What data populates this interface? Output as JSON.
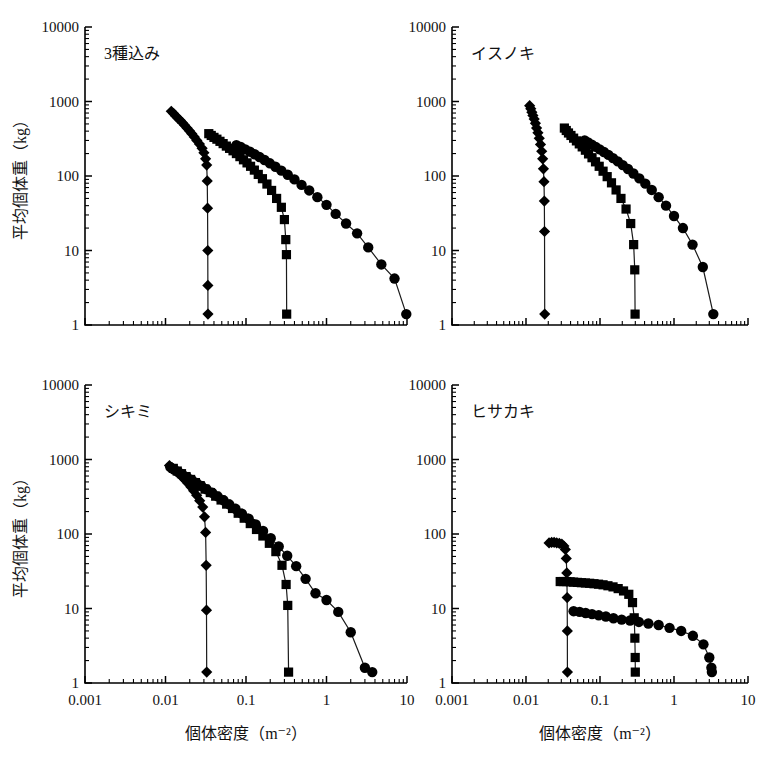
{
  "figure": {
    "axis_titles": {
      "x": "個体密度（m⁻²）",
      "y": "平均個体重（kg）"
    },
    "x_tick_labels": [
      "0.001",
      "0.01",
      "0.1",
      "1",
      "10"
    ],
    "y_tick_labels": [
      "10000",
      "1000",
      "100",
      "10",
      "1"
    ]
  },
  "chart_data": [
    {
      "type": "line",
      "title": "3種込み",
      "panel": "top-left",
      "xlabel": "個体密度（m⁻²）",
      "ylabel": "平均個体重（kg）",
      "xscale": "log",
      "yscale": "log",
      "xlim": [
        0.001,
        10
      ],
      "ylim": [
        1,
        10000
      ],
      "grid": false,
      "legend": "none",
      "series": [
        {
          "name": "diamond",
          "marker": "diamond",
          "x": [
            0.0118,
            0.0126,
            0.0134,
            0.0142,
            0.0152,
            0.0162,
            0.0173,
            0.0185,
            0.0198,
            0.0212,
            0.0228,
            0.0245,
            0.0264,
            0.0285,
            0.03,
            0.0315,
            0.0325,
            0.033,
            0.0333,
            0.0335,
            0.0336,
            0.0337
          ],
          "y": [
            740,
            690,
            640,
            600,
            560,
            520,
            480,
            440,
            405,
            370,
            335,
            300,
            268,
            235,
            205,
            170,
            140,
            86,
            37,
            10,
            3.4,
            1.4
          ]
        },
        {
          "name": "square",
          "marker": "square",
          "x": [
            0.0345,
            0.037,
            0.04,
            0.0435,
            0.0475,
            0.052,
            0.057,
            0.0625,
            0.069,
            0.076,
            0.084,
            0.093,
            0.103,
            0.114,
            0.127,
            0.142,
            0.16,
            0.182,
            0.208,
            0.24,
            0.275,
            0.3,
            0.312,
            0.318,
            0.32
          ],
          "y": [
            370,
            350,
            330,
            312,
            292,
            272,
            252,
            235,
            218,
            200,
            182,
            165,
            150,
            135,
            120,
            105,
            92,
            78,
            64,
            50,
            38,
            26,
            14,
            8.8,
            1.4
          ]
        },
        {
          "name": "circle",
          "marker": "circle",
          "x": [
            0.076,
            0.086,
            0.098,
            0.112,
            0.128,
            0.147,
            0.17,
            0.198,
            0.232,
            0.275,
            0.33,
            0.4,
            0.49,
            0.61,
            0.77,
            1.0,
            1.3,
            1.75,
            2.4,
            3.3,
            4.8,
            7.0,
            9.8
          ],
          "y": [
            260,
            245,
            228,
            212,
            196,
            180,
            164,
            148,
            133,
            118,
            104,
            90,
            76,
            64,
            52,
            41,
            31,
            23,
            17,
            11,
            6.5,
            4.2,
            1.4
          ]
        }
      ]
    },
    {
      "type": "line",
      "title": "イスノキ",
      "panel": "top-right",
      "xlabel": "個体密度（m⁻²）",
      "ylabel": "平均個体重（kg）",
      "xscale": "log",
      "yscale": "log",
      "xlim": [
        0.001,
        10
      ],
      "ylim": [
        1,
        10000
      ],
      "grid": false,
      "legend": "none",
      "series": [
        {
          "name": "diamond",
          "marker": "diamond",
          "x": [
            0.0112,
            0.0116,
            0.012,
            0.0124,
            0.0129,
            0.0134,
            0.0139,
            0.0145,
            0.0151,
            0.0157,
            0.0163,
            0.0168,
            0.0172,
            0.0175,
            0.0177,
            0.0178,
            0.0179
          ],
          "y": [
            880,
            800,
            720,
            650,
            580,
            510,
            440,
            380,
            320,
            265,
            215,
            170,
            125,
            84,
            46,
            18,
            1.4
          ]
        },
        {
          "name": "square",
          "marker": "square",
          "x": [
            0.033,
            0.035,
            0.0375,
            0.0405,
            0.044,
            0.048,
            0.0525,
            0.0575,
            0.0635,
            0.07,
            0.078,
            0.087,
            0.0975,
            0.11,
            0.125,
            0.143,
            0.165,
            0.192,
            0.225,
            0.26,
            0.285,
            0.295,
            0.298
          ],
          "y": [
            440,
            408,
            378,
            350,
            322,
            296,
            270,
            246,
            222,
            198,
            176,
            155,
            135,
            116,
            98,
            81,
            65,
            50,
            36,
            23,
            12,
            5.5,
            1.4
          ]
        },
        {
          "name": "circle",
          "marker": "circle",
          "x": [
            0.062,
            0.069,
            0.0775,
            0.0875,
            0.099,
            0.113,
            0.13,
            0.15,
            0.174,
            0.203,
            0.239,
            0.283,
            0.34,
            0.41,
            0.5,
            0.62,
            0.78,
            1.0,
            1.32,
            1.78,
            2.45,
            3.4
          ],
          "y": [
            300,
            282,
            264,
            246,
            228,
            210,
            192,
            174,
            157,
            140,
            124,
            108,
            93,
            79,
            65,
            52,
            40,
            29,
            20,
            12,
            6.0,
            1.4
          ]
        }
      ]
    },
    {
      "type": "line",
      "title": "シキミ",
      "panel": "bottom-left",
      "xlabel": "個体密度（m⁻²）",
      "ylabel": "平均個体重（kg）",
      "xscale": "log",
      "yscale": "log",
      "xlim": [
        0.001,
        10
      ],
      "ylim": [
        1,
        10000
      ],
      "grid": false,
      "legend": "none",
      "series": [
        {
          "name": "diamond",
          "marker": "diamond",
          "x": [
            0.0112,
            0.012,
            0.0129,
            0.0139,
            0.015,
            0.0162,
            0.0175,
            0.019,
            0.0206,
            0.0224,
            0.0244,
            0.0266,
            0.029,
            0.0305,
            0.0315,
            0.032,
            0.0323,
            0.0325
          ],
          "y": [
            830,
            780,
            730,
            680,
            630,
            580,
            530,
            480,
            430,
            380,
            330,
            280,
            230,
            170,
            105,
            38,
            9.5,
            1.4
          ]
        },
        {
          "name": "square",
          "marker": "square",
          "x": [
            0.0125,
            0.014,
            0.0158,
            0.018,
            0.0205,
            0.0235,
            0.027,
            0.031,
            0.036,
            0.042,
            0.049,
            0.0575,
            0.068,
            0.08,
            0.095,
            0.113,
            0.135,
            0.162,
            0.195,
            0.235,
            0.28,
            0.315,
            0.33,
            0.338
          ],
          "y": [
            760,
            700,
            645,
            590,
            540,
            490,
            445,
            400,
            360,
            322,
            286,
            252,
            220,
            190,
            163,
            138,
            115,
            94,
            75,
            58,
            38,
            21,
            11,
            1.4
          ]
        },
        {
          "name": "circle",
          "marker": "circle",
          "x": [
            0.0115,
            0.0128,
            0.0144,
            0.0163,
            0.0185,
            0.0212,
            0.0243,
            0.028,
            0.0325,
            0.038,
            0.0445,
            0.0525,
            0.062,
            0.074,
            0.089,
            0.108,
            0.132,
            0.163,
            0.203,
            0.255,
            0.325,
            0.42,
            0.55,
            0.73,
            1.0,
            1.4,
            2.0,
            3.0,
            3.7
          ],
          "y": [
            790,
            735,
            680,
            628,
            578,
            530,
            484,
            440,
            398,
            358,
            320,
            284,
            250,
            218,
            188,
            160,
            134,
            110,
            88,
            68,
            51,
            37,
            25,
            16,
            13,
            9.0,
            4.8,
            1.6,
            1.4
          ]
        }
      ]
    },
    {
      "type": "line",
      "title": "ヒサカキ",
      "panel": "bottom-right",
      "xlabel": "個体密度（m⁻²）",
      "ylabel": "平均個体重（kg）",
      "xscale": "log",
      "yscale": "log",
      "xlim": [
        0.001,
        10
      ],
      "ylim": [
        1,
        10000
      ],
      "grid": false,
      "legend": "none",
      "series": [
        {
          "name": "diamond",
          "marker": "diamond",
          "x": [
            0.0205,
            0.0222,
            0.024,
            0.026,
            0.0282,
            0.0305,
            0.0325,
            0.034,
            0.035,
            0.0356,
            0.036,
            0.0362,
            0.0363
          ],
          "y": [
            76,
            77,
            77,
            76,
            75,
            73,
            69,
            62,
            47,
            30,
            14,
            5.0,
            1.4
          ]
        },
        {
          "name": "square",
          "marker": "square",
          "x": [
            0.029,
            0.032,
            0.0355,
            0.0395,
            0.044,
            0.0495,
            0.056,
            0.0635,
            0.0725,
            0.083,
            0.0955,
            0.11,
            0.128,
            0.15,
            0.176,
            0.208,
            0.245,
            0.275,
            0.29,
            0.296,
            0.299,
            0.3
          ],
          "y": [
            23.0,
            23.0,
            23.0,
            22.8,
            22.6,
            22.4,
            22.2,
            22.0,
            21.8,
            21.5,
            21.2,
            20.8,
            20.2,
            19.5,
            18.5,
            17.2,
            15.5,
            12.0,
            7.5,
            4.0,
            2.2,
            1.4
          ]
        },
        {
          "name": "circle",
          "marker": "circle",
          "x": [
            0.044,
            0.053,
            0.064,
            0.078,
            0.096,
            0.12,
            0.152,
            0.196,
            0.255,
            0.335,
            0.45,
            0.62,
            0.87,
            1.25,
            1.8,
            2.5,
            3.0,
            3.2,
            3.25
          ],
          "y": [
            9.2,
            9.0,
            8.7,
            8.4,
            8.1,
            7.8,
            7.4,
            7.1,
            6.9,
            6.6,
            6.3,
            6.0,
            5.5,
            5.0,
            4.3,
            3.3,
            2.2,
            1.6,
            1.4
          ]
        }
      ]
    }
  ]
}
